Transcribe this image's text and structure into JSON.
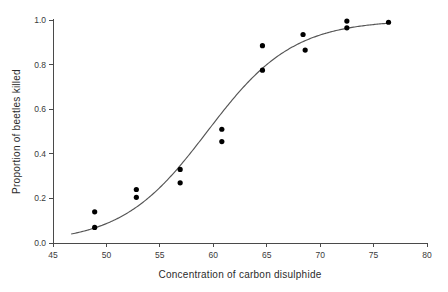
{
  "chart_data": {
    "type": "scatter",
    "title": "",
    "xlabel": "Concentration of carbon disulphide",
    "ylabel": "Proportion of beetles killed",
    "xlim": [
      45,
      80
    ],
    "ylim": [
      0.0,
      1.0
    ],
    "grid": false,
    "legend": null,
    "xticks": [
      45,
      50,
      55,
      60,
      65,
      70,
      75,
      80
    ],
    "xtick_labels": [
      "45",
      "50",
      "55",
      "60",
      "65",
      "70",
      "75",
      "80"
    ],
    "yticks": [
      0.0,
      0.2,
      0.4,
      0.6,
      0.8,
      1.0
    ],
    "ytick_labels": [
      "0.0",
      "0.2",
      "0.4",
      "0.6",
      "0.8",
      "1.0"
    ],
    "series": [
      {
        "name": "observed proportion killed",
        "marker": "filled-circle",
        "color": "#000000",
        "points": [
          {
            "x": 48.9,
            "y": 0.14
          },
          {
            "x": 48.9,
            "y": 0.07
          },
          {
            "x": 52.8,
            "y": 0.24
          },
          {
            "x": 52.8,
            "y": 0.205
          },
          {
            "x": 56.9,
            "y": 0.33
          },
          {
            "x": 56.9,
            "y": 0.27
          },
          {
            "x": 60.8,
            "y": 0.51
          },
          {
            "x": 60.8,
            "y": 0.455
          },
          {
            "x": 64.6,
            "y": 0.885
          },
          {
            "x": 64.6,
            "y": 0.775
          },
          {
            "x": 68.4,
            "y": 0.935
          },
          {
            "x": 68.6,
            "y": 0.865
          },
          {
            "x": 72.5,
            "y": 0.995
          },
          {
            "x": 72.5,
            "y": 0.965
          },
          {
            "x": 76.4,
            "y": 0.99
          }
        ]
      },
      {
        "name": "fitted logistic curve",
        "marker": "none",
        "color": "#555555",
        "curve": {
          "model": "logistic",
          "intercept": -14.8,
          "slope": 0.249,
          "x_start": 46.7,
          "x_end": 76.6
        }
      }
    ]
  }
}
